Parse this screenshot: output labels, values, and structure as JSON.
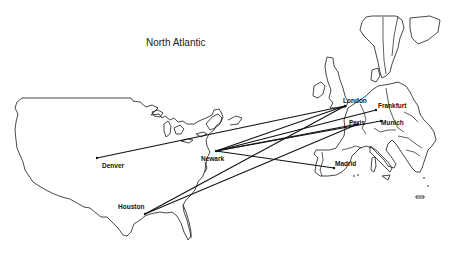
{
  "map": {
    "title": "North Atlantic",
    "region_label_position": {
      "x": 146,
      "y": 37
    },
    "cities": [
      {
        "name": "Denver",
        "x": 97,
        "y": 158,
        "label_x": 102,
        "label_y": 163
      },
      {
        "name": "Newark",
        "x": 216,
        "y": 151,
        "label_x": 201,
        "label_y": 156
      },
      {
        "name": "Houston",
        "x": 145,
        "y": 214,
        "label_x": 118,
        "label_y": 204
      },
      {
        "name": "London",
        "x": 345,
        "y": 106,
        "label_x": 343,
        "label_y": 98
      },
      {
        "name": "Frankfurt",
        "x": 376,
        "y": 110,
        "label_x": 378,
        "label_y": 103
      },
      {
        "name": "Paris",
        "x": 358,
        "y": 124,
        "label_x": 349,
        "label_y": 120
      },
      {
        "name": "Munich",
        "x": 381,
        "y": 121,
        "label_x": 381,
        "label_y": 120
      },
      {
        "name": "Madrid",
        "x": 334,
        "y": 168,
        "label_x": 335,
        "label_y": 161
      }
    ],
    "routes": [
      {
        "from": "Denver",
        "to": "London"
      },
      {
        "from": "Newark",
        "to": "London"
      },
      {
        "from": "Newark",
        "to": "Frankfurt"
      },
      {
        "from": "Newark",
        "to": "Paris"
      },
      {
        "from": "Newark",
        "to": "Munich"
      },
      {
        "from": "Newark",
        "to": "Madrid"
      },
      {
        "from": "Houston",
        "to": "London"
      },
      {
        "from": "Houston",
        "to": "Paris"
      }
    ],
    "line_color": "#111111"
  }
}
